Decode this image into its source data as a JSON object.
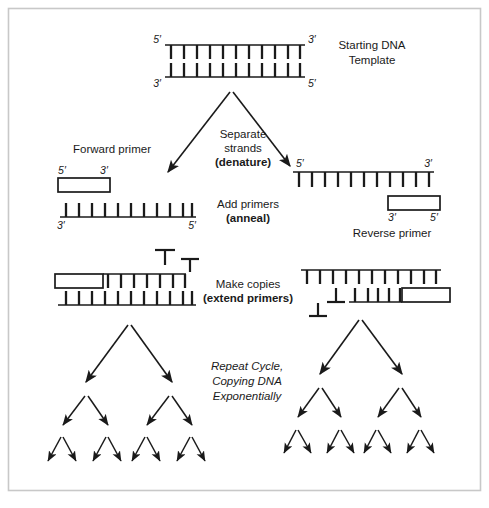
{
  "figure": {
    "title_alt": "PCR polymerase chain reaction schematic",
    "border_color": "#c8c8c8",
    "stroke_color": "#1a1a1a",
    "background": "#ffffff"
  },
  "labels": {
    "starting_template_line1": "Starting DNA",
    "starting_template_line2": "Template",
    "separate_line1": "Separate",
    "separate_line2": "strands",
    "separate_line3": "(denature)",
    "forward_primer": "Forward primer",
    "reverse_primer": "Reverse primer",
    "add_primers_line1": "Add primers",
    "add_primers_line2": "(anneal)",
    "make_copies_line1": "Make copies",
    "make_copies_line2": "(extend primers)",
    "repeat_line1": "Repeat Cycle,",
    "repeat_line2": "Copying DNA",
    "repeat_line3": "Exponentially"
  },
  "end_labels": {
    "five_prime": "5′",
    "three_prime": "3′"
  },
  "template": {
    "rungs": 11,
    "top_left_end": "5′",
    "top_right_end": "3′",
    "bottom_left_end": "3′",
    "bottom_right_end": "5′"
  },
  "denatured_left_strand": {
    "left_end": "3′",
    "right_end": "5′",
    "rungs": 11,
    "rung_direction": "up"
  },
  "denatured_right_strand": {
    "left_end": "5′",
    "right_end": "3′",
    "rungs": 11,
    "rung_direction": "down"
  },
  "forward_primer_box": {
    "left_end": "5′",
    "right_end": "3′"
  },
  "reverse_primer_box": {
    "left_end": "3′",
    "right_end": "5′"
  },
  "extension": {
    "free_nucleotides_left": 2,
    "free_nucleotides_right": 2,
    "left_duplex_top_rungs": 6,
    "left_duplex_bottom_rungs": 11,
    "right_duplex_top_rungs": 11,
    "right_duplex_bottom_rungs": 5
  },
  "amplification_tree": {
    "levels": 3,
    "arrow_counts": [
      2,
      4,
      8
    ],
    "trees": 2
  }
}
